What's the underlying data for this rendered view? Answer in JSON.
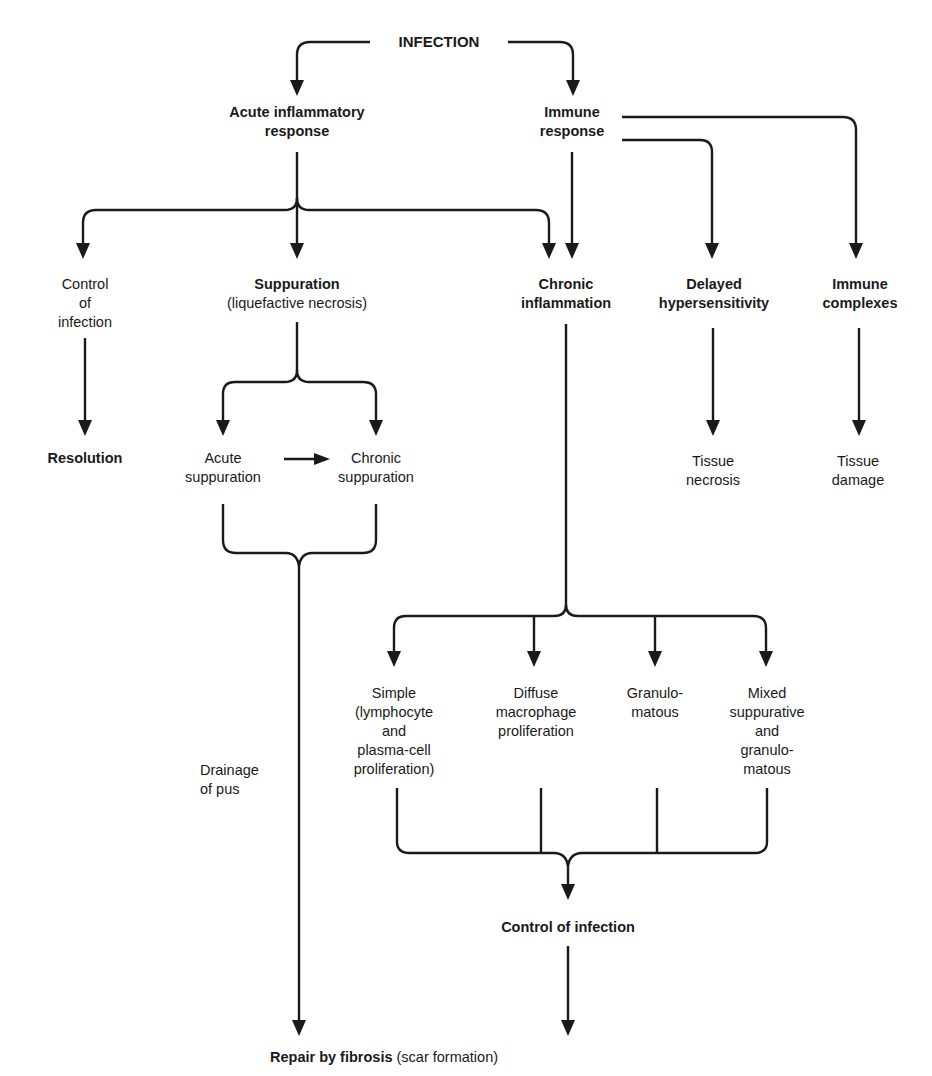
{
  "diagram": {
    "type": "flowchart",
    "nodes": {
      "infection": {
        "lines": [
          "INFECTION"
        ],
        "bold": true
      },
      "acute_inflammatory_response": {
        "lines": [
          "Acute inflammatory",
          "response"
        ],
        "bold": true
      },
      "immune_response": {
        "lines": [
          "Immune",
          "response"
        ],
        "bold": true
      },
      "control_of_infection_left": {
        "lines": [
          "Control",
          "of",
          "infection"
        ],
        "bold": false
      },
      "suppuration": {
        "lines": [
          "Suppuration",
          "(liquefactive necrosis)"
        ],
        "bold_first_line": true
      },
      "chronic_inflammation": {
        "lines": [
          "Chronic",
          "inflammation"
        ],
        "bold": true
      },
      "delayed_hypersensitivity": {
        "lines": [
          "Delayed",
          "hypersensitivity"
        ],
        "bold": true
      },
      "immune_complexes": {
        "lines": [
          "Immune",
          "complexes"
        ],
        "bold": true
      },
      "resolution": {
        "lines": [
          "Resolution"
        ],
        "bold": true
      },
      "acute_suppuration": {
        "lines": [
          "Acute",
          "suppuration"
        ],
        "bold": false
      },
      "chronic_suppuration": {
        "lines": [
          "Chronic",
          "suppuration"
        ],
        "bold": false
      },
      "tissue_necrosis": {
        "lines": [
          "Tissue",
          "necrosis"
        ],
        "bold": false
      },
      "tissue_damage": {
        "lines": [
          "Tissue",
          "damage"
        ],
        "bold": false
      },
      "simple": {
        "lines": [
          "Simple",
          "(lymphocyte",
          "and",
          "plasma-cell",
          "proliferation)"
        ],
        "bold": false
      },
      "diffuse": {
        "lines": [
          "Diffuse",
          "macrophage",
          "proliferation"
        ],
        "bold": false
      },
      "granulomatous": {
        "lines": [
          "Granulo-",
          "matous"
        ],
        "bold": false
      },
      "mixed": {
        "lines": [
          "Mixed",
          "suppurative",
          "and",
          "granulo-",
          "matous"
        ],
        "bold": false
      },
      "drainage_of_pus": {
        "lines": [
          "Drainage",
          "of pus"
        ],
        "bold": false
      },
      "control_of_infection_bottom": {
        "lines": [
          "Control of infection"
        ],
        "bold": true
      },
      "repair_by_fibrosis": {
        "bold_part": "Repair by fibrosis",
        "normal_part": " (scar formation)"
      }
    },
    "edges": [
      [
        "INFECTION",
        "Acute inflammatory response"
      ],
      [
        "INFECTION",
        "Immune response"
      ],
      [
        "Acute inflammatory response",
        "Control of infection"
      ],
      [
        "Acute inflammatory response",
        "Suppuration"
      ],
      [
        "Acute inflammatory response",
        "Chronic inflammation"
      ],
      [
        "Immune response",
        "Chronic inflammation"
      ],
      [
        "Immune response",
        "Delayed hypersensitivity"
      ],
      [
        "Immune response",
        "Immune complexes"
      ],
      [
        "Control of infection",
        "Resolution"
      ],
      [
        "Suppuration",
        "Acute suppuration"
      ],
      [
        "Suppuration",
        "Chronic suppuration"
      ],
      [
        "Acute suppuration",
        "Chronic suppuration"
      ],
      [
        "Delayed hypersensitivity",
        "Tissue necrosis"
      ],
      [
        "Immune complexes",
        "Tissue damage"
      ],
      [
        "Acute suppuration + Chronic suppuration",
        "Repair by fibrosis (via Drainage of pus)"
      ],
      [
        "Chronic inflammation",
        "Simple"
      ],
      [
        "Chronic inflammation",
        "Diffuse macrophage proliferation"
      ],
      [
        "Chronic inflammation",
        "Granulomatous"
      ],
      [
        "Chronic inflammation",
        "Mixed suppurative and granulomatous"
      ],
      [
        "Simple + Diffuse + Granulomatous + Mixed",
        "Control of infection (bottom)"
      ],
      [
        "Control of infection (bottom)",
        "Repair by fibrosis"
      ]
    ],
    "colors": {
      "ink": "#1a1a1a",
      "background": "#ffffff"
    }
  }
}
